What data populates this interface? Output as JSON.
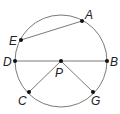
{
  "diagram": {
    "type": "circle-geometry",
    "colors": {
      "circle": "#7a7a7a",
      "segment": "#7a7a7a",
      "point": "#111111",
      "label": "#222222"
    },
    "circle": {
      "center": "P",
      "cx": 61,
      "cy": 61,
      "r": 46
    },
    "points": [
      {
        "id": "A",
        "label": "A",
        "x": 82,
        "y": 21,
        "lx": 85,
        "ly": 19
      },
      {
        "id": "E",
        "label": "E",
        "x": 21,
        "y": 40,
        "lx": 9,
        "ly": 45
      },
      {
        "id": "D",
        "label": "D",
        "x": 15,
        "y": 61,
        "lx": 3,
        "ly": 66
      },
      {
        "id": "B",
        "label": "B",
        "x": 107,
        "y": 61,
        "lx": 110,
        "ly": 66
      },
      {
        "id": "P",
        "label": "P",
        "x": 61,
        "y": 61,
        "lx": 55,
        "ly": 77
      },
      {
        "id": "C",
        "label": "C",
        "x": 29,
        "y": 92,
        "lx": 18,
        "ly": 105
      },
      {
        "id": "G",
        "label": "G",
        "x": 93,
        "y": 92,
        "lx": 91,
        "ly": 105
      }
    ],
    "segments": [
      {
        "from": "E",
        "to": "A",
        "name": "chord-EA"
      },
      {
        "from": "D",
        "to": "B",
        "name": "diameter-DB"
      },
      {
        "from": "P",
        "to": "C",
        "name": "radius-PC"
      },
      {
        "from": "P",
        "to": "G",
        "name": "radius-PG"
      }
    ]
  }
}
